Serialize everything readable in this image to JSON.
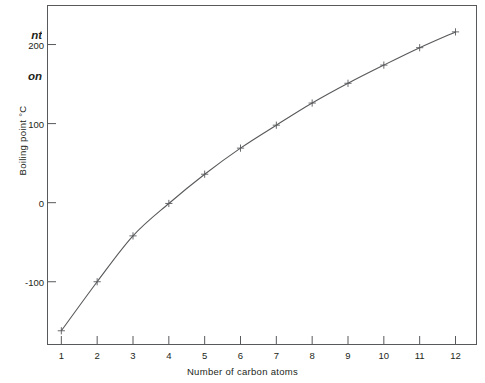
{
  "caption": {
    "line1": "nt",
    "line2": "on"
  },
  "chart_data": {
    "type": "line",
    "title": "",
    "xlabel": "Number of carbon atoms",
    "ylabel": "Boiling point °C",
    "xlim": [
      0.6,
      12.6
    ],
    "ylim": [
      -180,
      250
    ],
    "grid": false,
    "legend": null,
    "marker": "cross",
    "line_color": "#58595b",
    "x": [
      1,
      2,
      3,
      4,
      5,
      6,
      7,
      8,
      9,
      10,
      11,
      12
    ],
    "values": [
      -162,
      -100,
      -42,
      -1,
      36,
      69,
      98,
      126,
      151,
      174,
      196,
      216
    ],
    "xticks": [
      1,
      2,
      3,
      4,
      5,
      6,
      7,
      8,
      9,
      10,
      11,
      12
    ],
    "xtick_labels": [
      "1",
      "2",
      "3",
      "4",
      "5",
      "6",
      "7",
      "8",
      "9",
      "10",
      "11",
      "12"
    ],
    "yticks": [
      -100,
      0,
      100,
      200
    ],
    "ytick_labels": [
      "-100",
      "0",
      "100",
      "200"
    ]
  }
}
